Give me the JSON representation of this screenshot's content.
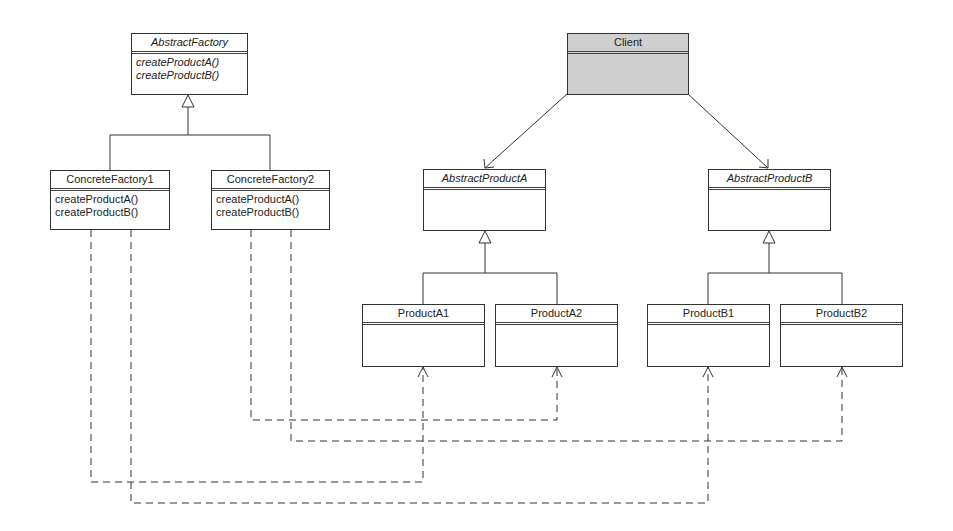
{
  "diagram": {
    "type": "UML class diagram",
    "pattern": "Abstract Factory",
    "colors": {
      "line": "#333333",
      "client_fill": "#cfcfcf",
      "box_fill": "#ffffff"
    },
    "classes": {
      "abstract_factory": {
        "name": "AbstractFactory",
        "abstract": true,
        "operations": [
          "createProductA()",
          "createProductB()"
        ]
      },
      "concrete_factory_1": {
        "name": "ConcreteFactory1",
        "abstract": false,
        "operations": [
          "createProductA()",
          "createProductB()"
        ]
      },
      "concrete_factory_2": {
        "name": "ConcreteFactory2",
        "abstract": false,
        "operations": [
          "createProductA()",
          "createProductB()"
        ]
      },
      "client": {
        "name": "Client",
        "abstract": false,
        "operations": []
      },
      "abstract_product_a": {
        "name": "AbstractProductA",
        "abstract": true,
        "operations": []
      },
      "abstract_product_b": {
        "name": "AbstractProductB",
        "abstract": true,
        "operations": []
      },
      "product_a1": {
        "name": "ProductA1",
        "abstract": false,
        "operations": []
      },
      "product_a2": {
        "name": "ProductA2",
        "abstract": false,
        "operations": []
      },
      "product_b1": {
        "name": "ProductB1",
        "abstract": false,
        "operations": []
      },
      "product_b2": {
        "name": "ProductB2",
        "abstract": false,
        "operations": []
      }
    },
    "relationships": [
      {
        "type": "generalization",
        "from": "ConcreteFactory1",
        "to": "AbstractFactory"
      },
      {
        "type": "generalization",
        "from": "ConcreteFactory2",
        "to": "AbstractFactory"
      },
      {
        "type": "association",
        "from": "Client",
        "to": "AbstractProductA"
      },
      {
        "type": "association",
        "from": "Client",
        "to": "AbstractProductB"
      },
      {
        "type": "generalization",
        "from": "ProductA1",
        "to": "AbstractProductA"
      },
      {
        "type": "generalization",
        "from": "ProductA2",
        "to": "AbstractProductA"
      },
      {
        "type": "generalization",
        "from": "ProductB1",
        "to": "AbstractProductB"
      },
      {
        "type": "generalization",
        "from": "ProductB2",
        "to": "AbstractProductB"
      },
      {
        "type": "dependency",
        "from": "ConcreteFactory1",
        "to": "ProductA1"
      },
      {
        "type": "dependency",
        "from": "ConcreteFactory1",
        "to": "ProductB1"
      },
      {
        "type": "dependency",
        "from": "ConcreteFactory2",
        "to": "ProductA2"
      },
      {
        "type": "dependency",
        "from": "ConcreteFactory2",
        "to": "ProductB2"
      }
    ]
  }
}
